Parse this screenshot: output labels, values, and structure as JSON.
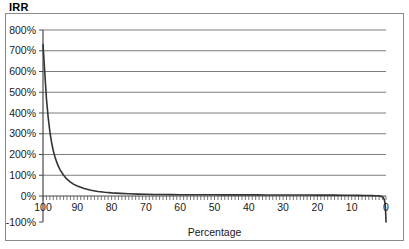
{
  "chart_data": {
    "type": "line",
    "title": "IRR",
    "xlabel": "Percentage",
    "ylabel": "IRR",
    "grid": true,
    "legend": false,
    "x_reversed": true,
    "xlim": [
      0,
      100
    ],
    "ylim": [
      -100,
      800
    ],
    "x_ticks": [
      100,
      90,
      80,
      70,
      60,
      50,
      40,
      30,
      20,
      10,
      0
    ],
    "x_tick_labels": [
      "100",
      "90",
      "80",
      "70",
      "60",
      "50",
      "40",
      "30",
      "20",
      "10",
      "0"
    ],
    "x_minor_tick_step": 1,
    "y_ticks": [
      -100,
      0,
      100,
      200,
      300,
      400,
      500,
      600,
      700,
      800
    ],
    "y_tick_labels": [
      "-100%",
      "0%",
      "100%",
      "200%",
      "300%",
      "400%",
      "500%",
      "600%",
      "700%",
      "800%"
    ],
    "series": [
      {
        "name": "IRR",
        "color": "#333333",
        "x": [
          100,
          99.5,
          99,
          98.5,
          98,
          97.5,
          97,
          96.5,
          96,
          95.5,
          95,
          94,
          93,
          92,
          91,
          90,
          88,
          86,
          84,
          82,
          80,
          77.5,
          75,
          72.5,
          70,
          67.5,
          65,
          62.5,
          60,
          57.5,
          55,
          52.5,
          50,
          47.5,
          45,
          42.5,
          40,
          37.5,
          35,
          32.5,
          30,
          27.5,
          25,
          22.5,
          20,
          17.5,
          15,
          12.5,
          10,
          8,
          6,
          5,
          4,
          3,
          2.5,
          2,
          1.5,
          1,
          0.7,
          0.5,
          0.3,
          0.15,
          0.05,
          0
        ],
        "y": [
          730,
          600,
          470,
          380,
          310,
          258,
          218,
          188,
          163,
          143,
          126,
          100,
          81,
          67,
          56,
          48,
          36,
          28,
          22,
          18,
          15,
          12.5,
          10.5,
          9.2,
          8.2,
          7.5,
          7,
          6.6,
          6.3,
          6.1,
          5.9,
          5.8,
          5.7,
          5.6,
          5.5,
          5.4,
          5.3,
          5.2,
          5.1,
          5.0,
          4.9,
          4.8,
          4.7,
          4.6,
          4.4,
          4.2,
          4.0,
          3.7,
          3.3,
          3.0,
          2.6,
          2.3,
          1.9,
          1.4,
          1.0,
          0.4,
          -1.0,
          -4.0,
          -8.0,
          -14.0,
          -26.0,
          -48.0,
          -78.0,
          -100
        ]
      }
    ]
  },
  "axes": {
    "y_axis_name": "y-axis",
    "x_axis_name": "x-axis"
  }
}
